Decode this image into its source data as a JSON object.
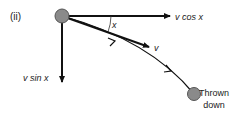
{
  "diagram": {
    "part_label": "(ii)",
    "angle_label": "x",
    "horizontal_component_label": "v cos x",
    "velocity_label": "v",
    "vertical_component_label": "v sin x",
    "caption_line1": "Thrown",
    "caption_line2": "down",
    "colors": {
      "ball_fill": "#8a8a8a",
      "ball_stroke": "#555555",
      "line": "#111111",
      "text": "#222222"
    }
  }
}
